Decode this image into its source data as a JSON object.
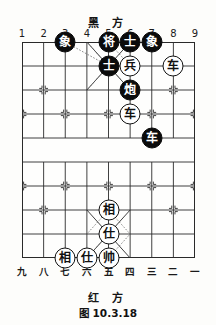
{
  "figure": {
    "caption": "图 10.3.18"
  },
  "board": {
    "black_side_label": "黑 方",
    "red_side_label": "红 方",
    "top_files": [
      "1",
      "2",
      "3",
      "4",
      "5",
      "6",
      "7",
      "8",
      "9"
    ],
    "bottom_files": [
      "九",
      "八",
      "七",
      "六",
      "五",
      "四",
      "三",
      "二",
      "一"
    ],
    "columns": 9,
    "rows": 10,
    "river_top_row": 4,
    "river_bottom_row": 5,
    "grid_color": "#2b2b2b",
    "black_piece_fill": "#0b0b0b",
    "black_piece_text": "#ffffff",
    "red_piece_fill": "#ffffff",
    "red_piece_text": "#111111"
  },
  "pieces": [
    {
      "name": "black-elephant-c3",
      "label": "象",
      "side": "black",
      "col": 2,
      "row": 0
    },
    {
      "name": "black-general-c5",
      "label": "将",
      "side": "black",
      "col": 4,
      "row": 0
    },
    {
      "name": "black-advisor-c6",
      "label": "士",
      "side": "black",
      "col": 5,
      "row": 0
    },
    {
      "name": "black-elephant-c7",
      "label": "象",
      "side": "black",
      "col": 6,
      "row": 0
    },
    {
      "name": "black-advisor-c5-r1",
      "label": "士",
      "side": "black",
      "col": 4,
      "row": 1
    },
    {
      "name": "red-pawn-c6-r1",
      "label": "兵",
      "side": "red",
      "col": 5,
      "row": 1
    },
    {
      "name": "red-chariot-c8-r1",
      "label": "车",
      "side": "red",
      "col": 7,
      "row": 1
    },
    {
      "name": "black-cannon-c6-r2",
      "label": "炮",
      "side": "black",
      "col": 5,
      "row": 2
    },
    {
      "name": "red-chariot-c6-r3",
      "label": "车",
      "side": "red",
      "col": 5,
      "row": 3
    },
    {
      "name": "black-chariot-c7-r4",
      "label": "车",
      "side": "black",
      "col": 6,
      "row": 4
    },
    {
      "name": "red-minister-c5-r7",
      "label": "相",
      "side": "red",
      "col": 4,
      "row": 7
    },
    {
      "name": "red-advisor-c5-r8",
      "label": "仕",
      "side": "red",
      "col": 4,
      "row": 8
    },
    {
      "name": "red-minister-c3-r9",
      "label": "相",
      "side": "red",
      "col": 2,
      "row": 9
    },
    {
      "name": "red-advisor-c4-r9",
      "label": "仕",
      "side": "red",
      "col": 3,
      "row": 9
    },
    {
      "name": "red-marshal-c5-r9",
      "label": "帅",
      "side": "red",
      "col": 4,
      "row": 9
    }
  ],
  "move_hints": [
    {
      "name": "hint-elephant-c3-to-c5r1",
      "from_col": 2,
      "from_row": 0,
      "to_col": 4,
      "to_row": 1
    },
    {
      "name": "hint-general-c5-to-c6r1",
      "from_col": 4,
      "from_row": 0,
      "to_col": 5,
      "to_row": 1
    },
    {
      "name": "hint-advisor-c5r1-to-c4r0",
      "from_col": 4,
      "from_row": 1,
      "to_col": 3,
      "to_row": 0
    },
    {
      "name": "hint-advisor-c5r1-to-c6r2",
      "from_col": 4,
      "from_row": 1,
      "to_col": 5,
      "to_row": 2
    },
    {
      "name": "hint-advisor-c5r1-to-c4r2",
      "from_col": 4,
      "from_row": 1,
      "to_col": 3,
      "to_row": 2
    },
    {
      "name": "hint-minister-c5r7-to-c3r9",
      "from_col": 4,
      "from_row": 7,
      "to_col": 3,
      "to_row": 8
    },
    {
      "name": "hint-minister-c5r7-to-c6r8",
      "from_col": 4,
      "from_row": 7,
      "to_col": 5,
      "to_row": 8
    },
    {
      "name": "hint-advisor-c5r8-to-c4r9",
      "from_col": 4,
      "from_row": 8,
      "to_col": 3,
      "to_row": 9
    },
    {
      "name": "hint-marshal-c5r9-to-c6r8",
      "from_col": 4,
      "from_row": 9,
      "to_col": 5,
      "to_row": 8
    }
  ]
}
